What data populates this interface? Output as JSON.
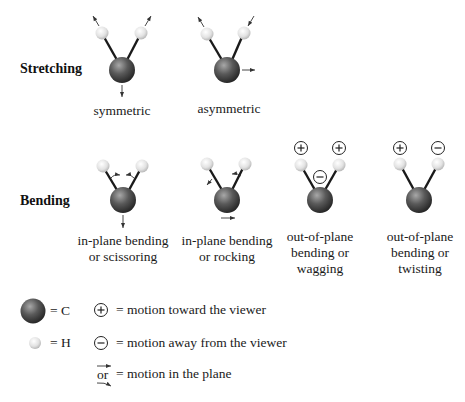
{
  "rows": {
    "stretching": {
      "title": "Stretching"
    },
    "bending": {
      "title": "Bending"
    }
  },
  "modes": {
    "symmetric": {
      "label_lines": [
        "symmetric"
      ]
    },
    "asymmetric": {
      "label_lines": [
        "asymmetric"
      ]
    },
    "scissoring": {
      "label_lines": [
        "in-plane bending",
        "or scissoring"
      ]
    },
    "rocking": {
      "label_lines": [
        "in-plane bending",
        "or rocking"
      ]
    },
    "wagging": {
      "label_lines": [
        "out-of-plane",
        "bending or",
        "wagging"
      ],
      "signs": {
        "h_left": "+",
        "h_right": "+",
        "center": "−"
      }
    },
    "twisting": {
      "label_lines": [
        "out-of-plane",
        "bending or",
        "twisting"
      ],
      "signs": {
        "h_left": "+",
        "h_right": "−"
      }
    }
  },
  "legend": {
    "carbon": {
      "symbol_icon": "carbon-atom-icon",
      "text": "= C"
    },
    "hydrogen": {
      "symbol_icon": "hydrogen-atom-icon",
      "text": "= H"
    },
    "toward": {
      "symbol": "+",
      "text": "= motion toward the viewer"
    },
    "away": {
      "symbol": "−",
      "text": "= motion away from the viewer"
    },
    "plane": {
      "or_text": "or",
      "text": "= motion in the plane"
    }
  },
  "colors": {
    "carbon_dark": "#2b2b2b",
    "carbon_light": "#8a8a8a",
    "hydrogen_light": "#f4f4f4",
    "hydrogen_dark": "#b8b8b8",
    "bond": "#1a1a1a",
    "text": "#1a1a1a"
  }
}
